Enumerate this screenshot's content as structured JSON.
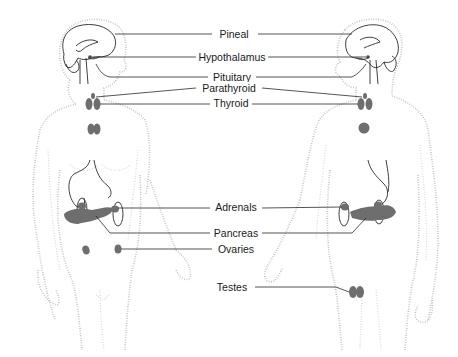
{
  "diagram": {
    "figures": [
      {
        "name": "female",
        "side": "left"
      },
      {
        "name": "male",
        "side": "right"
      }
    ],
    "labels": [
      {
        "id": "pineal",
        "text": "Pineal",
        "x": 234,
        "y": 11
      },
      {
        "id": "hypothalamus",
        "text": "Hypothalamus",
        "x": 232,
        "y": 40
      },
      {
        "id": "pituitary",
        "text": "Pituitary",
        "x": 232,
        "y": 68
      },
      {
        "id": "parathyroid",
        "text": "Parathyroid",
        "x": 229,
        "y": 82
      },
      {
        "id": "thyroid",
        "text": "Thyroid",
        "x": 231,
        "y": 95
      },
      {
        "id": "adrenals",
        "text": "Adrenals",
        "x": 236,
        "y": 201
      },
      {
        "id": "pancreas",
        "text": "Pancreas",
        "x": 236,
        "y": 227
      },
      {
        "id": "ovaries",
        "text": "Ovaries",
        "x": 236,
        "y": 244
      },
      {
        "id": "testes",
        "text": "Testes",
        "x": 232,
        "y": 280
      }
    ],
    "colors": {
      "organ_fill": "#6e6e6e",
      "outline_stipple": "#b8b8b8",
      "leader_line": "#2a2a2a",
      "text": "#1a1a1a"
    }
  }
}
